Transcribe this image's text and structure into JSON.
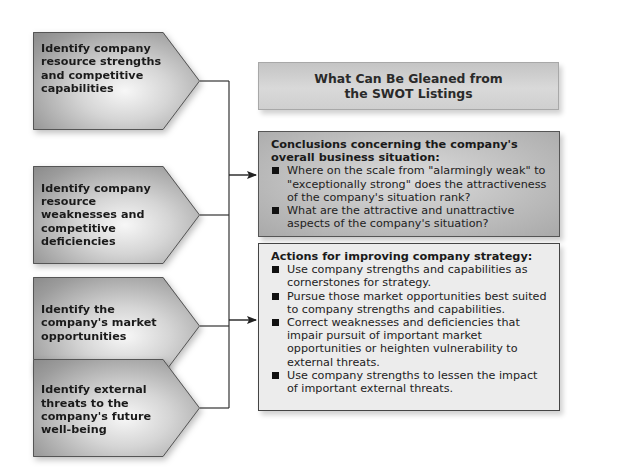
{
  "diagram": {
    "title": "What Can Be Gleaned from the SWOT Listings",
    "inputs": [
      {
        "id": "strengths",
        "label": "Identify company resource strengths and competitive capabilities"
      },
      {
        "id": "weaknesses",
        "label": "Identify company resource weaknesses and competitive deficiencies"
      },
      {
        "id": "opportunities",
        "label": "Identify the company's market opportunities"
      },
      {
        "id": "threats",
        "label": "Identify external threats to the company's future well-being"
      }
    ],
    "conclusions": {
      "heading": "Conclusions concerning the company's overall business situation:",
      "bullets": [
        "Where on the scale from \"alarmingly weak\" to \"exceptionally strong\" does the attractiveness of the company's situation rank?",
        "What are the attractive and unattractive aspects of the company's situation?"
      ]
    },
    "actions": {
      "heading": "Actions for improving company strategy:",
      "bullets": [
        "Use company strengths and capabilities as cornerstones for strategy.",
        "Pursue those market opportunities best suited to company strengths and capabilities.",
        "Correct weaknesses and deficiencies that impair pursuit of important market opportunities or heighten vulnerability to external threats.",
        "Use company strengths to lessen the impact of important external threats."
      ]
    },
    "colors": {
      "connector": "#222222",
      "conclusions_fill": "#bdbdbd",
      "actions_fill": "#ececec",
      "title_fill": "#d0d0d0"
    }
  }
}
